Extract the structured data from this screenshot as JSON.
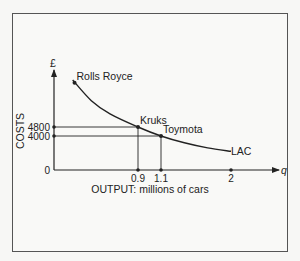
{
  "chart_data": {
    "type": "line",
    "title": "",
    "xlabel": "OUTPUT: millions of cars",
    "ylabel": "COSTS",
    "x_axis_symbol": "q",
    "y_axis_symbol": "£",
    "x_ticks": [
      {
        "value": 0.9,
        "label": "0.9"
      },
      {
        "value": 1.1,
        "label": "1.1"
      },
      {
        "value": 2,
        "label": "2"
      }
    ],
    "y_ticks": [
      {
        "value": 0,
        "label": "0"
      },
      {
        "value": 4000,
        "label": "4000"
      },
      {
        "value": 4800,
        "label": "4800"
      }
    ],
    "series": [
      {
        "name": "LAC",
        "label": "LAC",
        "points": [
          {
            "x": 0.2,
            "y": 9800
          },
          {
            "x": 0.4,
            "y": 7600
          },
          {
            "x": 0.6,
            "y": 6200
          },
          {
            "x": 0.9,
            "y": 4800
          },
          {
            "x": 1.1,
            "y": 4000
          },
          {
            "x": 1.4,
            "y": 3200
          },
          {
            "x": 1.7,
            "y": 2600
          },
          {
            "x": 2.0,
            "y": 2200
          }
        ]
      }
    ],
    "annotations": [
      {
        "name": "Rolls Royce",
        "label": "Rolls Royce",
        "x": 0.22,
        "y": 9500
      },
      {
        "name": "Kruks",
        "label": "Kruks",
        "x": 0.9,
        "y": 4800
      },
      {
        "name": "Toymota",
        "label": "Toymota",
        "x": 1.1,
        "y": 4000
      }
    ],
    "xlim": [
      0,
      2.4
    ],
    "ylim": [
      0,
      11000
    ],
    "grid": false,
    "legend": "none"
  }
}
